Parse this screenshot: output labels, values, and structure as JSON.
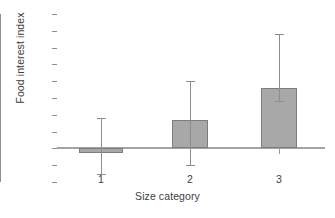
{
  "chart_data": {
    "type": "bar",
    "title": "",
    "xlabel": "Size category",
    "ylabel": "Food interest index",
    "categories": [
      "1",
      "2",
      "3"
    ],
    "values": [
      -0.15,
      0.85,
      1.8
    ],
    "error_upper": [
      0.9,
      2.0,
      3.4
    ],
    "error_lower": [
      -0.75,
      -0.48,
      1.4
    ],
    "ylim": [
      -1,
      4
    ],
    "yticks": [
      4,
      3.5,
      3,
      2.5,
      2,
      1.5,
      1,
      0.5,
      0,
      -0.5,
      -1
    ],
    "ytick_labels": [
      "4",
      "3.5",
      "3",
      "2.5",
      "2",
      "1.5",
      "1",
      "0.5",
      "0",
      "-0.5",
      "-1"
    ],
    "xtick_labels": [
      "1",
      "2",
      "3"
    ],
    "grid": false,
    "legend": false,
    "bar_color": "#a8a8a8",
    "bar_edge_color": "#7d7d7d",
    "axis_color": "#8e8e8e",
    "error_color": "#8d8d8d",
    "zero_line": 0
  },
  "caption_fragment": ""
}
